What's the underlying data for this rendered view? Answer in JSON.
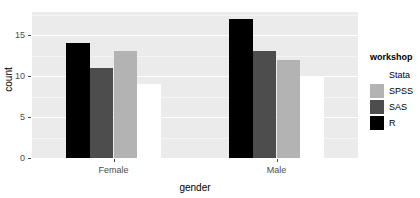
{
  "chart_data": {
    "type": "bar",
    "title": "",
    "xlabel": "gender",
    "ylabel": "count",
    "categories": [
      "Female",
      "Male"
    ],
    "series": [
      {
        "name": "Stata",
        "color": "#ffffff",
        "values": [
          9,
          10
        ]
      },
      {
        "name": "SPSS",
        "color": "#b3b3b3",
        "values": [
          13,
          12
        ]
      },
      {
        "name": "SAS",
        "color": "#4d4d4d",
        "values": [
          11,
          13
        ]
      },
      {
        "name": "R",
        "color": "#000000",
        "values": [
          14,
          17
        ]
      }
    ],
    "series_order_in_plot": [
      "R",
      "SAS",
      "SPSS",
      "Stata"
    ],
    "ylim": [
      0,
      17.8
    ],
    "yticks": [
      0,
      5,
      10,
      15
    ],
    "ytick_labels": [
      "0",
      "5",
      "10",
      "15"
    ],
    "xtick_labels": [
      "Female",
      "Male"
    ],
    "grid": true,
    "grid_minor": [
      2.5,
      7.5,
      12.5,
      17.5
    ],
    "legend": {
      "title": "workshop",
      "position": "right",
      "entries": [
        {
          "label": "Stata",
          "color": "#ffffff"
        },
        {
          "label": "SPSS",
          "color": "#b3b3b3"
        },
        {
          "label": "SAS",
          "color": "#4d4d4d"
        },
        {
          "label": "R",
          "color": "#000000"
        }
      ]
    },
    "panel_background": "#ebebeb",
    "gridline_color": "#ffffff"
  }
}
